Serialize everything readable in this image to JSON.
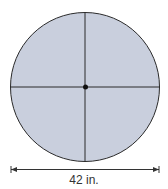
{
  "diagram": {
    "shape": "circle",
    "fill_color": "#c9cfdd",
    "stroke_color": "#2a2a2a",
    "center": [
      85,
      86
    ],
    "radius": 75,
    "diameter_label": "42 in."
  }
}
